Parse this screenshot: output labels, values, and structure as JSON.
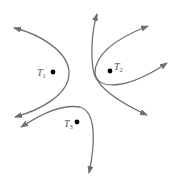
{
  "diagram": {
    "type": "isoclines / trajectories around three points",
    "stroke_color": "#707070",
    "points": [
      {
        "id": "T1",
        "label_main": "T",
        "label_sub": "1",
        "x": 53,
        "y": 72
      },
      {
        "id": "T2",
        "label_main": "T",
        "label_sub": "2",
        "x": 110,
        "y": 71
      },
      {
        "id": "T3",
        "label_main": "T",
        "label_sub": "3",
        "x": 77,
        "y": 122
      }
    ],
    "curves": [
      {
        "name": "curve-t1",
        "note": "parabola-like opening left around T1, arrows at both ends"
      },
      {
        "name": "curve-t2-outer",
        "note": "from top arrow down past T2 to lower-right arrow"
      },
      {
        "name": "curve-t2-inner",
        "note": "from upper-right arrow around left of T2 to right arrow"
      },
      {
        "name": "curve-t3",
        "note": "arch over T3 from left arrow to bottom arrow"
      }
    ]
  }
}
